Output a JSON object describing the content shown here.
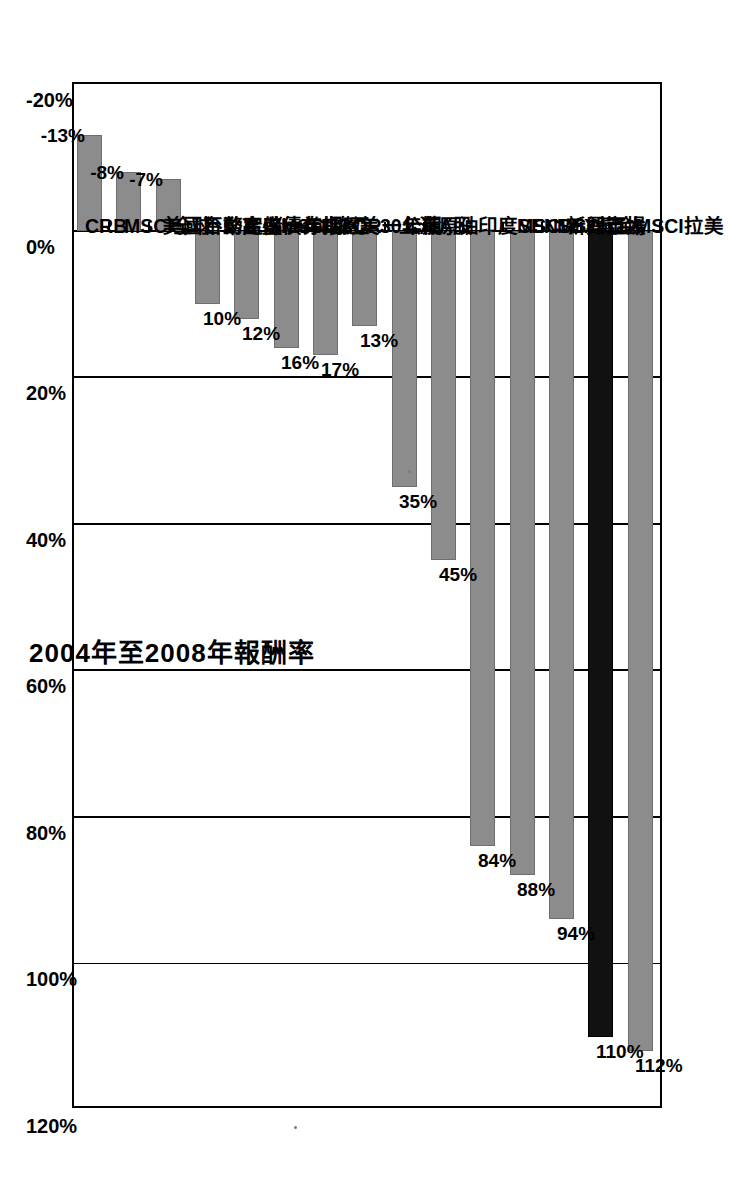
{
  "chart_data": {
    "type": "bar",
    "title": "2004年至2008年報酬率",
    "orientation": "vertical-bars-in-rotated-page",
    "xlabel": "",
    "ylabel": "",
    "ylim": [
      -20,
      120
    ],
    "ytick_step": 20,
    "grid": true,
    "legend": false,
    "axis_ticks": [
      "-20%",
      "0%",
      "20%",
      "40%",
      "60%",
      "80%",
      "100%",
      "120%"
    ],
    "categories": [
      "CRB",
      "MSCI全球",
      "美國不動產iShare",
      "台幣定儲一年期",
      "高盛債券指數",
      "MSCI歐亞",
      "LIBOR一年期",
      "美30公債",
      "上海A股",
      "原油",
      "印度SENSEX",
      "MSCI新興市場",
      "MSCI亞太",
      "黃金",
      "MSCI拉美"
    ],
    "values": [
      -13,
      -8,
      -7,
      10,
      12,
      16,
      17,
      13,
      35,
      45,
      84,
      88,
      94,
      110,
      112
    ],
    "value_labels": [
      "-13%",
      "-8%",
      "-7%",
      "10%",
      "12%",
      "16%",
      "17%",
      "13%",
      "35%",
      "45%",
      "84%",
      "88%",
      "94%",
      "110%",
      "112%"
    ],
    "highlight_category": "黃金",
    "colors": {
      "bar": "#8c8c8c",
      "bar_highlight": "#111111",
      "axis": "#000000",
      "background": "#ffffff"
    }
  }
}
